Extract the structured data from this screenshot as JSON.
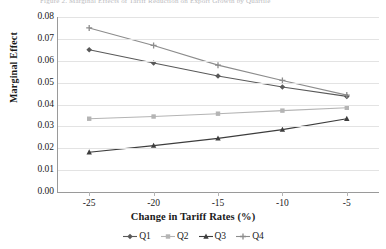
{
  "figure": {
    "top_caption": "Figure 2.   Marginal Effects of Tariff Reduction on Export Growth by Quartile"
  },
  "chart_data": {
    "type": "line",
    "title": "",
    "xlabel": "Change in Tariff Rates (%)",
    "ylabel": "Marginal Effect",
    "x": [
      -25,
      -20,
      -15,
      -10,
      -5
    ],
    "xtick_labels": [
      "-25",
      "-20",
      "-15",
      "-10",
      "-5"
    ],
    "xlim": [
      -27.5,
      -2.5
    ],
    "ylim": [
      0.0,
      0.08
    ],
    "ytick_labels": [
      "0.00",
      "0.01",
      "0.02",
      "0.03",
      "0.04",
      "0.05",
      "0.06",
      "0.07",
      "0.08"
    ],
    "ytick_values": [
      0.0,
      0.01,
      0.02,
      0.03,
      0.04,
      0.05,
      0.06,
      0.07,
      0.08
    ],
    "grid": "horizontal",
    "legend_position": "bottom-center",
    "series": [
      {
        "name": "Q1",
        "color": "#595959",
        "marker": "diamond",
        "values": [
          0.065,
          0.059,
          0.053,
          0.048,
          0.0437
        ]
      },
      {
        "name": "Q2",
        "color": "#b4b4b4",
        "marker": "square",
        "values": [
          0.0335,
          0.0345,
          0.0358,
          0.0372,
          0.0385
        ]
      },
      {
        "name": "Q3",
        "color": "#3d3d3d",
        "marker": "triangle",
        "values": [
          0.0182,
          0.0212,
          0.0245,
          0.0285,
          0.0335
        ]
      },
      {
        "name": "Q4",
        "color": "#8c8c8c",
        "marker": "cross",
        "values": [
          0.075,
          0.067,
          0.058,
          0.051,
          0.0443
        ]
      }
    ]
  }
}
